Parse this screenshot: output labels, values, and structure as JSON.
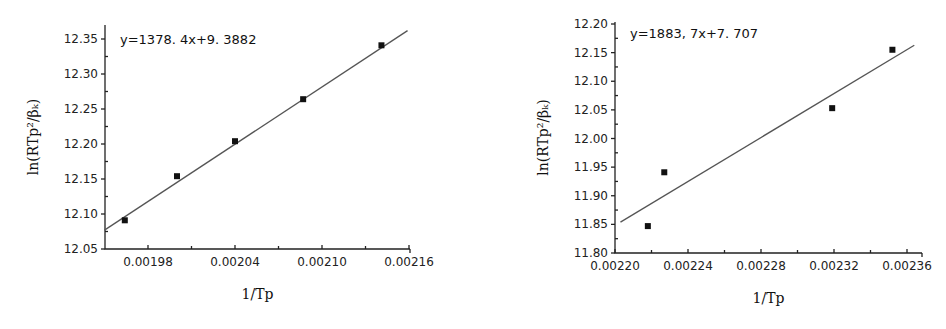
{
  "chart_data": [
    {
      "type": "scatter",
      "title": "",
      "annotation": "y=1378. 4x+9. 3882",
      "xlabel": "1/Tp",
      "ylabel": "ln(RTp²/βₖ)",
      "xlim": [
        0.00195,
        0.00216
      ],
      "ylim": [
        12.05,
        12.37
      ],
      "xticks": [
        0.00198,
        0.00204,
        0.0021,
        0.00216
      ],
      "xtick_labels": [
        "0.00198",
        "0.00204",
        "0.00210",
        "0.00216"
      ],
      "yticks": [
        12.05,
        12.1,
        12.15,
        12.2,
        12.25,
        12.3,
        12.35
      ],
      "ytick_labels": [
        "12.05",
        "12.10",
        "12.15",
        "12.20",
        "12.25",
        "12.30",
        "12.35"
      ],
      "grid": false,
      "series": [
        {
          "name": "data",
          "x": [
            0.001964,
            0.002,
            0.00204,
            0.002087,
            0.002141
          ],
          "y": [
            12.091,
            12.154,
            12.204,
            12.264,
            12.341
          ]
        }
      ],
      "fit_line": {
        "x": [
          0.00195,
          0.002159
        ],
        "y": [
          12.077,
          12.362
        ]
      },
      "layout": {
        "x0": 105,
        "x1": 410,
        "y0": 249,
        "y1": 25,
        "xref_px": 148,
        "xref_val": 0.00198,
        "xpx_per_unit": 1450000,
        "yref_px": 249,
        "yref_val": 12.05,
        "ypx_per_unit": 700
      }
    },
    {
      "type": "scatter",
      "title": "",
      "annotation": "y=1883, 7x+7. 707",
      "xlabel": "1/Tp",
      "ylabel": "ln(RTp²/βₖ)",
      "xlim": [
        0.0022,
        0.002368
      ],
      "ylim": [
        11.8,
        12.2
      ],
      "xticks": [
        0.0022,
        0.00224,
        0.00228,
        0.00232,
        0.00236
      ],
      "xtick_labels": [
        "0.00220",
        "0.00224",
        "0.00228",
        "0.00232",
        "0.00236"
      ],
      "yticks": [
        11.8,
        11.85,
        11.9,
        11.95,
        12.0,
        12.05,
        12.1,
        12.15,
        12.2
      ],
      "ytick_labels": [
        "11.80",
        "11.85",
        "11.90",
        "11.95",
        "12.00",
        "12.05",
        "12.10",
        "12.15",
        "12.20"
      ],
      "grid": false,
      "series": [
        {
          "name": "data",
          "x": [
            0.002218,
            0.002227,
            0.002319,
            0.002352
          ],
          "y": [
            11.847,
            11.941,
            12.053,
            12.155
          ]
        }
      ],
      "fit_line": {
        "x": [
          0.002203,
          0.002364
        ],
        "y": [
          11.854,
          12.163
        ]
      },
      "layout": {
        "x0": 615,
        "x1": 922,
        "y0": 253,
        "y1": 22,
        "xref_px": 615,
        "xref_val": 0.0022,
        "xpx_per_unit": 1825000,
        "yref_px": 253,
        "yref_val": 11.8,
        "ypx_per_unit": 572.5
      }
    }
  ]
}
